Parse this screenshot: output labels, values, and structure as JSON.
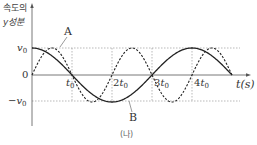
{
  "figure": {
    "ylabel_line1": "속도의",
    "ylabel_line2": "y성분",
    "xlabel": "t(s)",
    "caption": "(나)",
    "y_ticks": {
      "pos": "v",
      "zero": "0",
      "neg": "−v"
    },
    "y_tick_sub": "0",
    "x_ticks": [
      {
        "coef": "",
        "var": "t",
        "sub": "0"
      },
      {
        "coef": "2",
        "var": "t",
        "sub": "0"
      },
      {
        "coef": "3",
        "var": "t",
        "sub": "0"
      },
      {
        "coef": "4",
        "var": "t",
        "sub": "0"
      }
    ],
    "curve_labels": {
      "A": "A",
      "B": "B"
    }
  },
  "chart_data": {
    "type": "line",
    "title": "",
    "xlabel": "t(s)",
    "ylabel": "속도의 y성분",
    "x_unit": "t0",
    "x_ticks": [
      "t0",
      "2t0",
      "3t0",
      "4t0"
    ],
    "y_ticks": [
      "-v0",
      "0",
      "v0"
    ],
    "xlim": [
      0,
      5
    ],
    "ylim": [
      -1,
      1
    ],
    "grid": "dotted reference lines at ±v0 and at t0, 2t0, 3t0, 4t0",
    "series": [
      {
        "name": "A",
        "style": "dashed",
        "description": "v0·sin(πt/t0)",
        "x": [
          0,
          0.5,
          1,
          1.5,
          2,
          2.5,
          3,
          3.5,
          4,
          4.5,
          5
        ],
        "values": [
          0,
          1,
          0,
          -1,
          0,
          1,
          0,
          -1,
          0,
          1,
          0
        ]
      },
      {
        "name": "B",
        "style": "solid",
        "description": "v0·cos(πt/(2t0))",
        "x": [
          0,
          1,
          2,
          3,
          4,
          5
        ],
        "values": [
          1,
          0,
          -1,
          0,
          1,
          0
        ]
      }
    ],
    "colors": {
      "curves": "#222222",
      "axes": "#555555",
      "grid": "#888888"
    }
  }
}
